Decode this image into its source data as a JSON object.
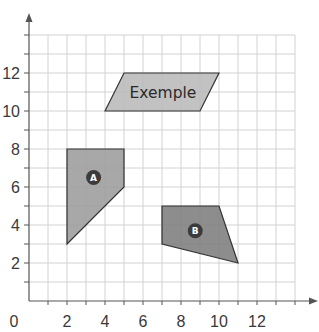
{
  "chart_data": {
    "type": "diagram",
    "title": "",
    "x_axis": {
      "tick_labels": [
        "0",
        "2",
        "4",
        "6",
        "8",
        "10",
        "12"
      ],
      "tick_values": [
        0,
        2,
        4,
        6,
        8,
        10,
        12
      ],
      "range": [
        0,
        14
      ],
      "grid_step": 1
    },
    "y_axis": {
      "tick_labels": [
        "2",
        "4",
        "6",
        "8",
        "10",
        "12"
      ],
      "tick_values": [
        2,
        4,
        6,
        8,
        10,
        12
      ],
      "range": [
        0,
        14
      ],
      "grid_step": 1
    },
    "grid": true,
    "shapes": [
      {
        "id": "exemple",
        "label": "Exemple",
        "label_style": "text",
        "points": [
          [
            4,
            10
          ],
          [
            5,
            12
          ],
          [
            10,
            12
          ],
          [
            9,
            10
          ]
        ],
        "label_pos": [
          7.05,
          10.95
        ],
        "fill": "#b9b9b9"
      },
      {
        "id": "A",
        "label": "A",
        "label_style": "badge",
        "points": [
          [
            2,
            8
          ],
          [
            5,
            8
          ],
          [
            5,
            6
          ],
          [
            2,
            3
          ]
        ],
        "label_pos": [
          3.4,
          6.5
        ],
        "fill": "#9c9c9c"
      },
      {
        "id": "B",
        "label": "B",
        "label_style": "badge",
        "points": [
          [
            7,
            5
          ],
          [
            10,
            5
          ],
          [
            11,
            2
          ],
          [
            7,
            3
          ]
        ],
        "label_pos": [
          8.75,
          3.7
        ],
        "fill": "#7d7d7d"
      }
    ]
  },
  "colors": {
    "grid": "#d2d2d2",
    "axis": "#555555",
    "badge": "#3b3b3b",
    "outline": "#333333"
  }
}
